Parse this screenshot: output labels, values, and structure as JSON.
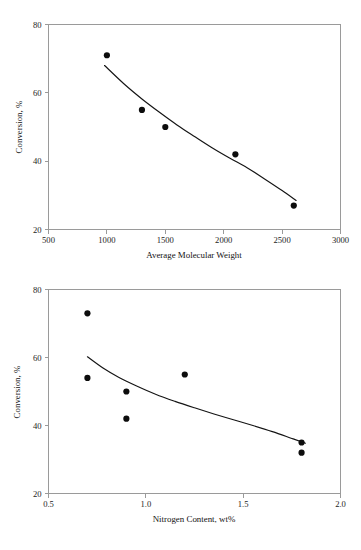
{
  "page": {
    "background": "#ffffff",
    "ink": "#141414",
    "axis_color": "#9a9a9a"
  },
  "chart_data": [
    {
      "id": "chart-molecular-weight",
      "type": "scatter",
      "title": "",
      "xlabel": "Average Molecular Weight",
      "ylabel": "Conversion, %",
      "xlim": [
        500,
        3000
      ],
      "ylim": [
        20,
        80
      ],
      "xticks": [
        500,
        1000,
        1500,
        2000,
        2500,
        3000
      ],
      "xticklabels": [
        "500",
        "1000",
        "1500",
        "2000",
        "2500",
        "3000"
      ],
      "yticks": [
        20,
        40,
        60,
        80
      ],
      "yticklabels": [
        "20",
        "40",
        "60",
        "80"
      ],
      "grid": false,
      "legend": null,
      "series": [
        {
          "name": "Conversion data",
          "marker": "filled-circle",
          "color": "#0d0d0d",
          "points": [
            {
              "x": 1000,
              "y": 71
            },
            {
              "x": 1300,
              "y": 55
            },
            {
              "x": 1500,
              "y": 50
            },
            {
              "x": 2100,
              "y": 42
            },
            {
              "x": 2600,
              "y": 27
            }
          ]
        },
        {
          "name": "Fitted trend",
          "type": "line",
          "color": "#141414",
          "points": [
            {
              "x": 980,
              "y": 68.0
            },
            {
              "x": 1150,
              "y": 62.5
            },
            {
              "x": 1300,
              "y": 58.2
            },
            {
              "x": 1450,
              "y": 54.3
            },
            {
              "x": 1600,
              "y": 50.6
            },
            {
              "x": 1750,
              "y": 47.2
            },
            {
              "x": 1900,
              "y": 43.9
            },
            {
              "x": 2050,
              "y": 40.9
            },
            {
              "x": 2200,
              "y": 38.1
            },
            {
              "x": 2350,
              "y": 34.8
            },
            {
              "x": 2500,
              "y": 31.4
            },
            {
              "x": 2620,
              "y": 28.5
            }
          ]
        }
      ]
    },
    {
      "id": "chart-nitrogen-content",
      "type": "scatter",
      "title": "",
      "xlabel": "Nitrogen Content, wt%",
      "ylabel": "Conversion, %",
      "xlim": [
        0.5,
        2.0
      ],
      "ylim": [
        20,
        80
      ],
      "xticks": [
        0.5,
        1.0,
        1.5,
        2.0
      ],
      "xticklabels": [
        "0.5",
        "1.0",
        "1.5",
        "2.0"
      ],
      "yticks": [
        20,
        40,
        60,
        80
      ],
      "yticklabels": [
        "20",
        "40",
        "60",
        "80"
      ],
      "grid": false,
      "legend": null,
      "series": [
        {
          "name": "Conversion data",
          "marker": "filled-circle",
          "color": "#0d0d0d",
          "points": [
            {
              "x": 0.7,
              "y": 73
            },
            {
              "x": 0.7,
              "y": 54
            },
            {
              "x": 0.9,
              "y": 50
            },
            {
              "x": 0.9,
              "y": 42
            },
            {
              "x": 1.2,
              "y": 55
            },
            {
              "x": 1.8,
              "y": 35
            },
            {
              "x": 1.8,
              "y": 32
            }
          ]
        },
        {
          "name": "Fitted trend",
          "type": "line",
          "color": "#141414",
          "points": [
            {
              "x": 0.7,
              "y": 60.2
            },
            {
              "x": 0.78,
              "y": 56.9
            },
            {
              "x": 0.86,
              "y": 54.2
            },
            {
              "x": 0.95,
              "y": 51.7
            },
            {
              "x": 1.05,
              "y": 49.2
            },
            {
              "x": 1.15,
              "y": 47.1
            },
            {
              "x": 1.25,
              "y": 45.2
            },
            {
              "x": 1.35,
              "y": 43.4
            },
            {
              "x": 1.45,
              "y": 41.7
            },
            {
              "x": 1.55,
              "y": 40.0
            },
            {
              "x": 1.65,
              "y": 38.2
            },
            {
              "x": 1.75,
              "y": 36.2
            },
            {
              "x": 1.82,
              "y": 34.8
            }
          ]
        }
      ]
    }
  ]
}
